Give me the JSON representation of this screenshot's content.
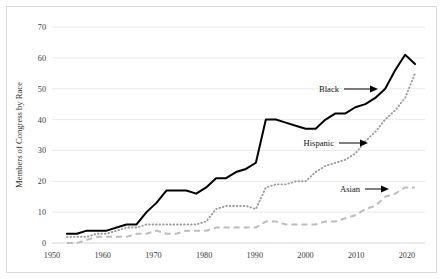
{
  "chart_data": {
    "type": "line",
    "title": "",
    "xlabel": "",
    "ylabel": "Members of Congress by Race",
    "xlim": [
      1950,
      2025
    ],
    "ylim": [
      0,
      70
    ],
    "grid": true,
    "legend_position": "inline-annotations",
    "xticks": [
      "1950",
      "1960",
      "1970",
      "1980",
      "1990",
      "2000",
      "2010",
      "2020"
    ],
    "xtick_values": [
      1950,
      1960,
      1970,
      1980,
      1990,
      2000,
      2010,
      2020
    ],
    "yticks": [
      "0",
      "10",
      "20",
      "30",
      "40",
      "50",
      "60",
      "70"
    ],
    "ytick_values": [
      0,
      10,
      20,
      30,
      40,
      50,
      60,
      70
    ],
    "series": [
      {
        "name": "Black",
        "style": "solid",
        "color": "#000000",
        "x": [
          1953,
          1955,
          1957,
          1959,
          1961,
          1963,
          1965,
          1967,
          1969,
          1971,
          1973,
          1975,
          1977,
          1979,
          1981,
          1983,
          1985,
          1987,
          1989,
          1991,
          1993,
          1995,
          1997,
          1999,
          2001,
          2003,
          2005,
          2007,
          2009,
          2011,
          2013,
          2015,
          2017,
          2019,
          2021,
          2023
        ],
        "values": [
          3,
          3,
          4,
          4,
          4,
          5,
          6,
          6,
          10,
          13,
          17,
          17,
          17,
          16,
          18,
          21,
          21,
          23,
          24,
          26,
          40,
          40,
          39,
          38,
          37,
          37,
          40,
          42,
          42,
          44,
          45,
          47,
          50,
          56,
          61,
          58
        ]
      },
      {
        "name": "Hispanic",
        "style": "dotted",
        "color": "#9a9a9a",
        "x": [
          1953,
          1955,
          1957,
          1959,
          1961,
          1963,
          1965,
          1967,
          1969,
          1971,
          1973,
          1975,
          1977,
          1979,
          1981,
          1983,
          1985,
          1987,
          1989,
          1991,
          1993,
          1995,
          1997,
          1999,
          2001,
          2003,
          2005,
          2007,
          2009,
          2011,
          2013,
          2015,
          2017,
          2019,
          2021,
          2023
        ],
        "values": [
          2,
          2,
          2,
          3,
          3,
          4,
          5,
          5,
          6,
          6,
          6,
          6,
          6,
          6,
          7,
          11,
          12,
          12,
          12,
          11,
          18,
          19,
          19,
          20,
          20,
          23,
          25,
          26,
          27,
          29,
          33,
          36,
          40,
          43,
          47,
          55
        ]
      },
      {
        "name": "Asian",
        "style": "dashed",
        "color": "#bdbdbd",
        "x": [
          1953,
          1955,
          1957,
          1959,
          1961,
          1963,
          1965,
          1967,
          1969,
          1971,
          1973,
          1975,
          1977,
          1979,
          1981,
          1983,
          1985,
          1987,
          1989,
          1991,
          1993,
          1995,
          1997,
          1999,
          2001,
          2003,
          2005,
          2007,
          2009,
          2011,
          2013,
          2015,
          2017,
          2019,
          2021,
          2023
        ],
        "values": [
          0,
          0,
          1,
          2,
          2,
          2,
          2,
          3,
          3,
          4,
          3,
          3,
          4,
          4,
          4,
          5,
          5,
          5,
          5,
          5,
          7,
          7,
          6,
          6,
          6,
          6,
          7,
          7,
          8,
          9,
          11,
          12,
          15,
          16,
          18,
          18
        ]
      }
    ],
    "annotations": [
      {
        "label": "Black",
        "target_series": "Black"
      },
      {
        "label": "Hispanic",
        "target_series": "Hispanic"
      },
      {
        "label": "Asian",
        "target_series": "Asian"
      }
    ]
  }
}
